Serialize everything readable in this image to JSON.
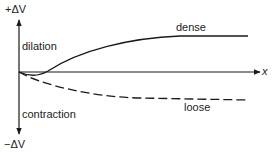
{
  "figure": {
    "y_axis_top_label": "+ΔV",
    "y_axis_bottom_label": "−ΔV",
    "x_axis_label": "x",
    "region_upper_label": "dilation",
    "region_lower_label": "contraction",
    "curves": [
      {
        "name": "dense",
        "style": "solid",
        "description": "initial slight contraction then dilation, levelling off to a plateau"
      },
      {
        "name": "loose",
        "style": "dashed",
        "description": "continuous contraction, levelling off below the axis"
      }
    ]
  }
}
